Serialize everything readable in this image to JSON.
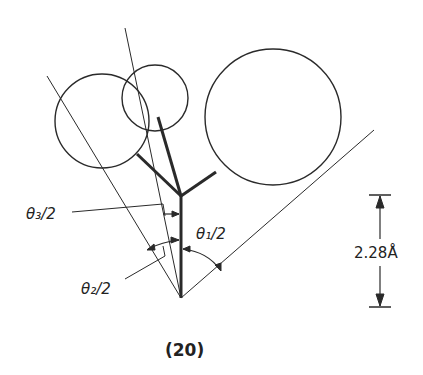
{
  "figure": {
    "caption": "(20)",
    "labels": {
      "theta1": "θ₁/2",
      "theta2": "θ₂/2",
      "theta3": "θ₃/2",
      "distance": "2.28Å"
    },
    "colors": {
      "stroke": "#2a2a2a",
      "background": "#ffffff"
    }
  }
}
